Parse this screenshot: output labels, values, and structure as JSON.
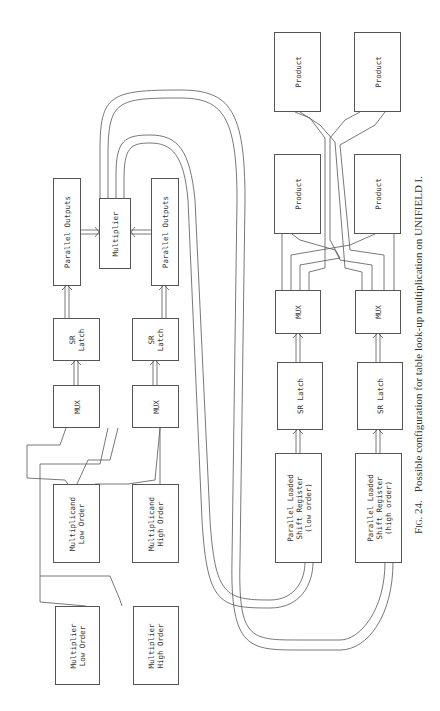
{
  "figure": {
    "number": "Fig. 24.",
    "caption": "Possible configuration for table look-up multiplication on UNIFIELD I."
  },
  "diagram": {
    "left_side": {
      "parallel_outputs_upper": "Parallel Outputs",
      "multiplier_unit": "Multiplier",
      "parallel_outputs_lower": "Parallel Outputs",
      "sr_latch_upper": "SR\nLatch",
      "sr_latch_lower": "SR\nLatch",
      "mux_upper": "MUX",
      "mux_lower": "MUX",
      "multiplicand_low": "Multiplicand\nLow Order",
      "multiplicand_high": "Multiplicand\nHigh Order",
      "multiplier_low": "Multiplier\nLow Order",
      "multiplier_high": "Multiplier\nHigh Order"
    },
    "right_side": {
      "product_1": "Product",
      "product_2": "Product",
      "product_3": "Product",
      "product_4": "Product",
      "mux_left": "MUX",
      "mux_right": "MUX",
      "sr_latch_left": "SR Latch",
      "sr_latch_right": "SR Latch",
      "shift_register_low": "Parallel Loaded\nShift Register\n(low order)",
      "shift_register_high": "Parallel Loaded\nShift Register\n(high order)"
    }
  }
}
